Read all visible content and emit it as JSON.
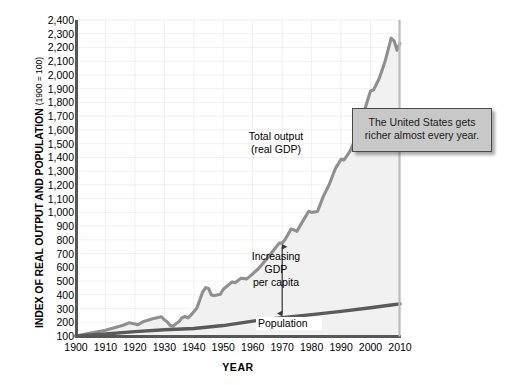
{
  "chart_data": {
    "type": "line",
    "title": "",
    "xlabel": "YEAR",
    "ylabel": "INDEX OF REAL OUTPUT AND POPULATION",
    "ylabel_note": "(1900 = 100)",
    "xlim": [
      1900,
      2010
    ],
    "ylim": [
      100,
      2400
    ],
    "grid": true,
    "legend_position": "inline-annotations",
    "xticks": [
      1900,
      1910,
      1920,
      1930,
      1940,
      1950,
      1960,
      1970,
      1980,
      1990,
      2000,
      2010
    ],
    "xtick_labels": [
      "1900",
      "1910",
      "1920",
      "1930",
      "1940",
      "1950",
      "1960",
      "1970",
      "1980",
      "1990",
      "2000",
      "2010"
    ],
    "yticks": [
      100,
      200,
      300,
      400,
      500,
      600,
      700,
      800,
      900,
      1000,
      1100,
      1200,
      1300,
      1400,
      1500,
      1600,
      1700,
      1800,
      1900,
      2000,
      2100,
      2200,
      2300,
      2400
    ],
    "ytick_labels": [
      "100",
      "200",
      "300",
      "400",
      "500",
      "600",
      "700",
      "800",
      "900",
      "1,000",
      "1,100",
      "1,200",
      "1,300",
      "1,400",
      "1,500",
      "1,600",
      "1,700",
      "1,800",
      "1,900",
      "2,000",
      "2,100",
      "2,200",
      "2,300",
      "2,400"
    ],
    "series": [
      {
        "name": "Total output (real GDP)",
        "color": "#8f8f8f",
        "fill": "#f0f0f0",
        "x": [
          1900,
          1905,
          1910,
          1913,
          1916,
          1918,
          1920,
          1921,
          1923,
          1926,
          1929,
          1930,
          1931,
          1932,
          1933,
          1934,
          1935,
          1936,
          1937,
          1938,
          1939,
          1941,
          1943,
          1944,
          1945,
          1946,
          1947,
          1949,
          1950,
          1953,
          1954,
          1956,
          1958,
          1960,
          1962,
          1965,
          1967,
          1969,
          1970,
          1971,
          1973,
          1974,
          1975,
          1977,
          1979,
          1980,
          1982,
          1984,
          1986,
          1988,
          1990,
          1991,
          1993,
          1995,
          1997,
          1999,
          2000,
          2001,
          2003,
          2005,
          2007,
          2008,
          2009,
          2010
        ],
        "y": [
          100,
          122,
          142,
          160,
          178,
          196,
          188,
          182,
          206,
          226,
          240,
          218,
          202,
          176,
          172,
          190,
          206,
          232,
          242,
          232,
          252,
          302,
          420,
          452,
          446,
          398,
          394,
          404,
          440,
          494,
          488,
          520,
          516,
          552,
          592,
          668,
          722,
          776,
          778,
          802,
          878,
          872,
          862,
          936,
          1008,
          1000,
          1006,
          1118,
          1204,
          1316,
          1386,
          1382,
          1444,
          1538,
          1672,
          1816,
          1884,
          1890,
          1978,
          2104,
          2268,
          2248,
          2180,
          2230
        ]
      },
      {
        "name": "Population",
        "color": "#5a5a5a",
        "x": [
          1900,
          1910,
          1920,
          1930,
          1940,
          1950,
          1960,
          1970,
          1980,
          1990,
          2000,
          2007,
          2010
        ],
        "y": [
          100,
          115,
          132,
          146,
          155,
          176,
          208,
          234,
          256,
          279,
          306,
          326,
          334
        ]
      }
    ],
    "annotations": [
      {
        "name": "total-output-label",
        "text_lines": [
          "Total output",
          "(real GDP)"
        ]
      },
      {
        "name": "gdp-per-capita-label",
        "text_lines": [
          "Increasing",
          "GDP",
          "per capita"
        ],
        "arrow": "double-headed vertical at 1970 between population and GDP lines"
      },
      {
        "name": "population-label",
        "text_lines": [
          "Population"
        ]
      }
    ],
    "callout": {
      "text": "The United States gets richer almost every year.",
      "background": "#c8c8c8",
      "border": "#4a4a4a"
    }
  },
  "axis_titles": {
    "y_main": "INDEX OF REAL OUTPUT AND POPULATION",
    "y_sub": "(1900 = 100)",
    "x": "YEAR"
  },
  "labels": {
    "total_output_line1": "Total output",
    "total_output_line2": "(real GDP)",
    "gdp_line1": "Increasing",
    "gdp_line2": "GDP",
    "gdp_line3": "per capita",
    "population": "Population"
  },
  "callout_text": {
    "line1": "The United States gets",
    "line2": "richer almost every year."
  },
  "colors": {
    "gdp_line": "#8f8f8f",
    "population_line": "#5a5a5a",
    "axis": "#555555",
    "area_fill": "#f0f0f0",
    "grid": "#e4e4e4",
    "callout_bg": "#c8c8c8",
    "callout_border": "#4a4a4a"
  }
}
